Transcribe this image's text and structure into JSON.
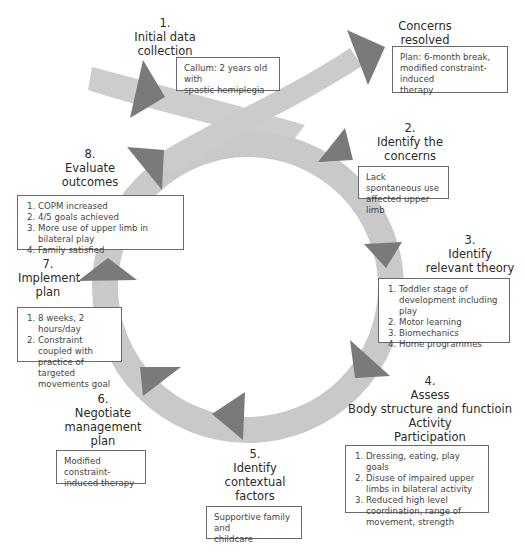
{
  "colors": {
    "ring": "#c9c9c9",
    "arrowhead": "#7a7a7a",
    "box_border": "#6a6a6a",
    "text": "#2a2a2a"
  },
  "steps": {
    "s1": {
      "number": "1.",
      "title_lines": [
        "Initial data",
        "collection"
      ],
      "box": {
        "type": "text",
        "lines": [
          "Callum: 2 years old with",
          "spastic hemiplegia"
        ]
      }
    },
    "resolved": {
      "title_lines": [
        "Concerns",
        "resolved"
      ],
      "box": {
        "type": "text",
        "lines": [
          "Plan: 6-month break,",
          "modified constraint-induced",
          "therapy"
        ]
      }
    },
    "s2": {
      "number": "2.",
      "title_lines": [
        "Identify the",
        "concerns"
      ],
      "box": {
        "type": "text",
        "lines": [
          "Lack spontaneous use",
          "affected upper limb"
        ]
      }
    },
    "s3": {
      "number": "3.",
      "title_lines": [
        "Identify",
        "relevant theory"
      ],
      "box": {
        "type": "list",
        "items": [
          "Toddler stage of development including play",
          "Motor learning",
          "Biomechanics",
          "Home programmes"
        ]
      }
    },
    "s4": {
      "number": "4.",
      "title_lines": [
        "Assess",
        "Body structure and functioin",
        "Activity",
        "Participation"
      ],
      "box": {
        "type": "list",
        "items": [
          "Dressing, eating, play goals",
          "Disuse of impaired upper limbs in bilateral activity",
          "Reduced high level coordination, range of movement, strength"
        ]
      }
    },
    "s5": {
      "number": "5.",
      "title_lines": [
        "Identify",
        "contextual",
        "factors"
      ],
      "box": {
        "type": "text",
        "lines": [
          "Supportive family and",
          "childcare"
        ]
      }
    },
    "s6": {
      "number": "6.",
      "title_lines": [
        "Negotiate",
        "management",
        "plan"
      ],
      "box": {
        "type": "text",
        "lines": [
          "Modified constraint-",
          "induced therapy"
        ]
      }
    },
    "s7": {
      "number": "7.",
      "title_lines": [
        "Implement",
        "plan"
      ],
      "box": {
        "type": "list",
        "items": [
          "8 weeks, 2 hours/day",
          "Constraint coupled with practice of targeted movements goal"
        ]
      }
    },
    "s8": {
      "number": "8.",
      "title_lines": [
        "Evaluate",
        "outcomes"
      ],
      "box": {
        "type": "list",
        "items": [
          "COPM increased",
          "4/5 goals achieved",
          "More use of upper limb in bilateral play",
          "Family satisfied"
        ]
      }
    }
  }
}
